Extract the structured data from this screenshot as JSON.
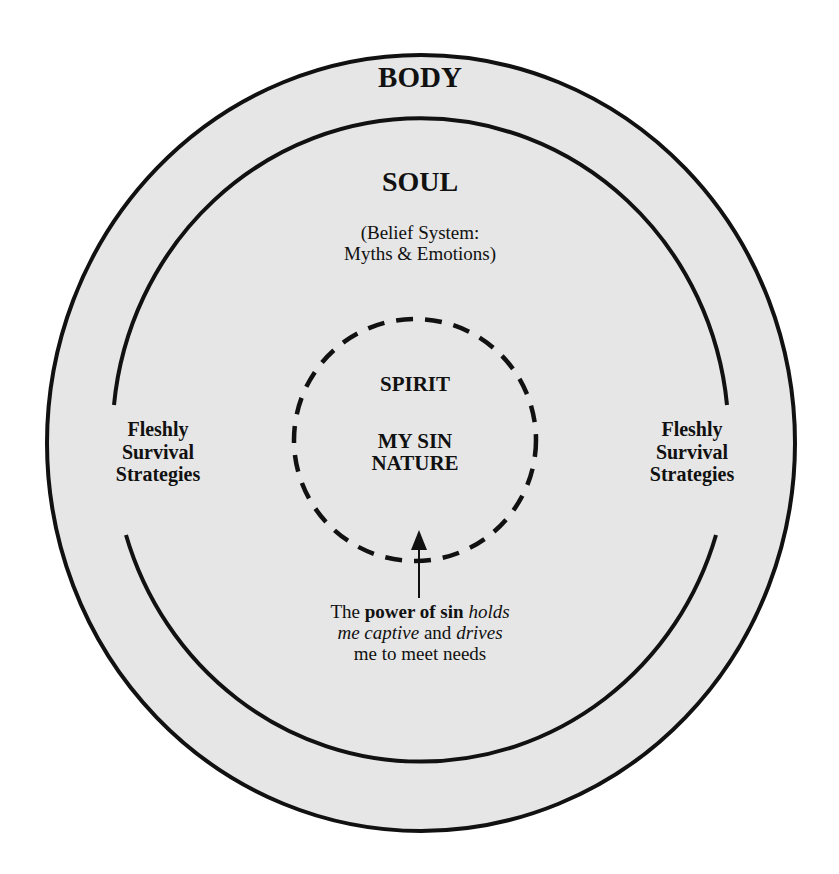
{
  "diagram": {
    "outer_ring": {
      "label": "BODY"
    },
    "middle_ring": {
      "label": "SOUL",
      "description_line1": "(Belief System:",
      "description_line2": "Myths & Emotions)"
    },
    "inner_core": {
      "label": "SPIRIT",
      "sublabel_line1": "MY SIN",
      "sublabel_line2": "NATURE",
      "border_style": "dashed"
    },
    "left_side": {
      "line1": "Fleshly",
      "line2": "Survival",
      "line3": "Strategies"
    },
    "right_side": {
      "line1": "Fleshly",
      "line2": "Survival",
      "line3": "Strategies"
    },
    "caption": {
      "part1": "The ",
      "part2_bold": "power of sin",
      "part3": " ",
      "part4_italic": "holds",
      "part5_italic": "me captive",
      "part6": " and ",
      "part7_italic": "drives",
      "part8": "me to meet needs"
    },
    "colors": {
      "fill": "#e6e6e6",
      "stroke": "#111111",
      "background": "#ffffff"
    }
  }
}
